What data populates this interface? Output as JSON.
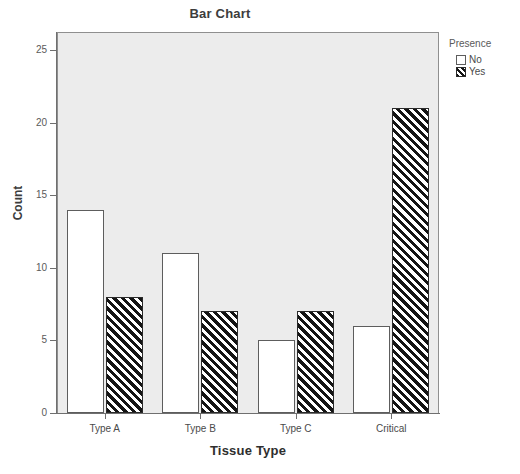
{
  "title": "Bar Chart",
  "axis": {
    "x_label": "Tissue Type",
    "y_label": "Count"
  },
  "y_ticks": [
    "0",
    "5",
    "10",
    "15",
    "20",
    "25"
  ],
  "x_ticks": [
    "Type A",
    "Type B",
    "Type C",
    "Critical"
  ],
  "legend": {
    "title": "Presence",
    "entries": [
      {
        "label": "No",
        "swatch": "white-square-swatch"
      },
      {
        "label": "Yes",
        "swatch": "hatched-square-swatch"
      }
    ]
  },
  "colors": {
    "plot_background": "#ececec",
    "axis": "#6f6f6f",
    "bar_no_fill": "#ffffff",
    "bar_yes_fill": "#141414",
    "bar_outline": "#5d5d5d"
  },
  "chart_data": {
    "type": "bar",
    "title": "Bar Chart",
    "xlabel": "Tissue Type",
    "ylabel": "Count",
    "categories": [
      "Type A",
      "Type B",
      "Type C",
      "Critical"
    ],
    "series": [
      {
        "name": "No",
        "values": [
          14,
          11,
          5,
          6
        ]
      },
      {
        "name": "Yes",
        "values": [
          8,
          7,
          7,
          21
        ]
      }
    ],
    "ylim": [
      0,
      26
    ],
    "yticks": [
      0,
      5,
      10,
      15,
      20,
      25
    ],
    "grid": false,
    "legend_title": "Presence",
    "legend_position": "right"
  },
  "bottom_caption": ""
}
